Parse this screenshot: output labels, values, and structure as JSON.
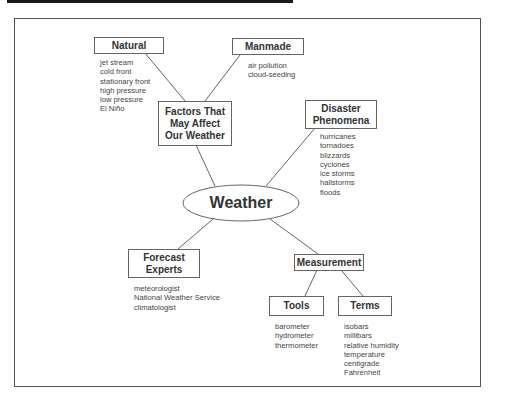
{
  "diagram": {
    "center": {
      "label": "Weather"
    },
    "nodes": {
      "factors": {
        "label_lines": [
          "Factors That",
          "May Affect",
          "Our Weather"
        ]
      },
      "natural": {
        "label": "Natural",
        "items": [
          "jet stream",
          "cold front",
          "stationary front",
          "high pressure",
          "low pressure",
          "El Niño"
        ]
      },
      "manmade": {
        "label": "Manmade",
        "items": [
          "air pollution",
          "cloud-seeding"
        ]
      },
      "disaster": {
        "label_lines": [
          "Disaster",
          "Phenomena"
        ],
        "items": [
          "hurricanes",
          "tornadoes",
          "blizzards",
          "cyclones",
          "ice storms",
          "hailstorms",
          "floods"
        ]
      },
      "forecast": {
        "label_lines": [
          "Forecast",
          "Experts"
        ],
        "items": [
          "meteorologist",
          "National Weather Service",
          "climatologist"
        ]
      },
      "measurement": {
        "label": "Measurement"
      },
      "tools": {
        "label": "Tools",
        "items": [
          "barometer",
          "hydrometer",
          "thermometer"
        ]
      },
      "terms": {
        "label": "Terms",
        "items": [
          "isobars",
          "millibars",
          "relative humidity",
          "temperature",
          "centigrade",
          "Fahrenheit"
        ]
      }
    },
    "colors": {
      "line": "#555555",
      "text": "#333333",
      "background": "#ffffff"
    }
  }
}
